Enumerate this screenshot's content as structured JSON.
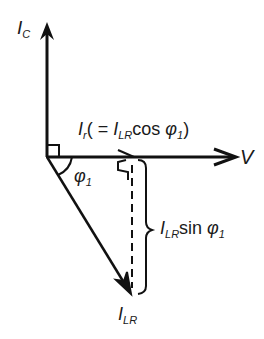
{
  "diagram": {
    "type": "phasor-diagram",
    "colors": {
      "line": "#111111",
      "background": "#ffffff"
    },
    "labels": {
      "ic": {
        "main": "I",
        "sub": "C"
      },
      "v": "V",
      "ir": {
        "main": "I",
        "sub": "r",
        "paren_open": "( = ",
        "i": "I",
        "i_sub": "LR",
        "func": "cos",
        "phi": "φ",
        "phi_sub": "1",
        "paren_close": ")"
      },
      "phi1": {
        "main": "φ",
        "sub": "1"
      },
      "ilr_sin": {
        "i": "I",
        "i_sub": "LR",
        "func": "sin",
        "phi": "φ",
        "phi_sub": "1"
      },
      "ilr": {
        "main": "I",
        "sub": "LR"
      }
    },
    "vectors": [
      {
        "name": "I_C",
        "direction": "up"
      },
      {
        "name": "V",
        "direction": "right"
      },
      {
        "name": "I_LR",
        "direction": "down-right"
      }
    ]
  }
}
